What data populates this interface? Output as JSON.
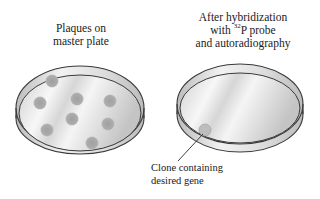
{
  "left_panel": {
    "title_line1": "Plaques on",
    "title_line2": "master plate",
    "plaques": [
      {
        "cx": 52,
        "cy": 81
      },
      {
        "cx": 40,
        "cy": 103
      },
      {
        "cx": 77,
        "cy": 99
      },
      {
        "cx": 110,
        "cy": 101
      },
      {
        "cx": 72,
        "cy": 119
      },
      {
        "cx": 47,
        "cy": 130
      },
      {
        "cx": 108,
        "cy": 124
      },
      {
        "cx": 92,
        "cy": 143
      }
    ]
  },
  "right_panel": {
    "title_line1": "After hybridization",
    "title_line2_pre": "with ",
    "title_line2_sup": "32",
    "title_line2_post": "P probe",
    "title_line3": "and autoradiography",
    "hit_spot": {
      "cx": 205,
      "cy": 130
    }
  },
  "callout": {
    "line1": "Clone containing",
    "line2": "desired gene"
  },
  "colors": {
    "dish_outline": "#3a3a3a",
    "plaque_fill": "#a9a9a9",
    "dish_fill_light": "#f4f4f4",
    "dish_fill_dark": "#c8c8c8"
  }
}
